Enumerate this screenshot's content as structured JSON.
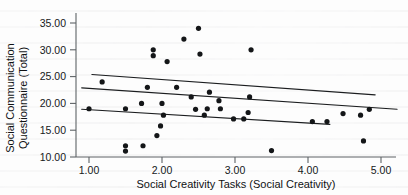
{
  "chart_data": {
    "type": "scatter",
    "title": "",
    "xlabel": "Social Creativity Tasks (Social Creativity)",
    "ylabel": "Social Communication Questionnaire (Total)",
    "ylabel_line1": "Social Communication",
    "ylabel_line2": "Questionnaire (Total)",
    "xlim": [
      0.72,
      5.22
    ],
    "ylim": [
      9.1,
      36.4
    ],
    "xticks": [
      1.0,
      2.0,
      3.0,
      4.0,
      5.0
    ],
    "xticklabels": [
      "1.00",
      "2.00",
      "3.00",
      "4.00",
      "5.00"
    ],
    "yticks": [
      10.0,
      15.0,
      20.0,
      25.0,
      30.0,
      35.0
    ],
    "yticklabels": [
      "10.00",
      "15.00",
      "20.00",
      "25.00",
      "30.00",
      "35.00"
    ],
    "grid": false,
    "legend": null,
    "marker": "filled-circle",
    "marker_color": "#141618",
    "points": [
      {
        "x": 1.0,
        "y": 19.0
      },
      {
        "x": 1.18,
        "y": 24.0
      },
      {
        "x": 1.5,
        "y": 19.0
      },
      {
        "x": 1.5,
        "y": 12.1
      },
      {
        "x": 1.5,
        "y": 11.1
      },
      {
        "x": 1.72,
        "y": 20.0
      },
      {
        "x": 1.74,
        "y": 12.1
      },
      {
        "x": 1.8,
        "y": 23.0
      },
      {
        "x": 1.88,
        "y": 28.9
      },
      {
        "x": 1.88,
        "y": 30.0
      },
      {
        "x": 1.93,
        "y": 14.0
      },
      {
        "x": 1.98,
        "y": 15.8
      },
      {
        "x": 2.0,
        "y": 20.0
      },
      {
        "x": 2.02,
        "y": 17.8
      },
      {
        "x": 2.07,
        "y": 27.8
      },
      {
        "x": 2.2,
        "y": 23.0
      },
      {
        "x": 2.3,
        "y": 32.0
      },
      {
        "x": 2.4,
        "y": 21.2
      },
      {
        "x": 2.46,
        "y": 18.9
      },
      {
        "x": 2.5,
        "y": 34.0
      },
      {
        "x": 2.52,
        "y": 29.2
      },
      {
        "x": 2.58,
        "y": 17.8
      },
      {
        "x": 2.62,
        "y": 19.0
      },
      {
        "x": 2.65,
        "y": 22.1
      },
      {
        "x": 2.78,
        "y": 20.5
      },
      {
        "x": 2.8,
        "y": 19.0
      },
      {
        "x": 2.98,
        "y": 17.1
      },
      {
        "x": 3.12,
        "y": 17.1
      },
      {
        "x": 3.18,
        "y": 18.3
      },
      {
        "x": 3.2,
        "y": 21.2
      },
      {
        "x": 3.22,
        "y": 30.0
      },
      {
        "x": 3.5,
        "y": 11.2
      },
      {
        "x": 4.06,
        "y": 16.6
      },
      {
        "x": 4.26,
        "y": 16.6
      },
      {
        "x": 4.48,
        "y": 18.1
      },
      {
        "x": 4.72,
        "y": 17.8
      },
      {
        "x": 4.76,
        "y": 13.0
      },
      {
        "x": 4.84,
        "y": 18.9
      }
    ],
    "fit_lines": [
      {
        "name": "upper-fit",
        "x0": 1.04,
        "y0": 25.4,
        "x1": 4.92,
        "y1": 21.6
      },
      {
        "name": "middle-fit",
        "x0": 0.9,
        "y0": 22.9,
        "x1": 5.22,
        "y1": 18.9
      },
      {
        "name": "lower-fit",
        "x0": 0.9,
        "y0": 18.9,
        "x1": 4.3,
        "y1": 16.1
      }
    ]
  }
}
